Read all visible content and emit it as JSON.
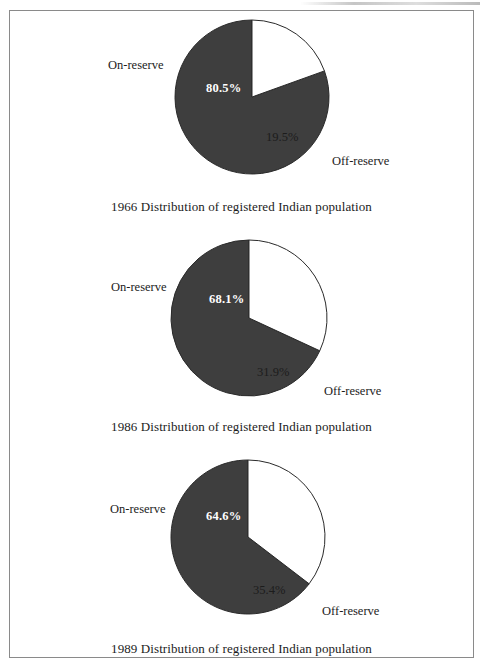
{
  "figure": {
    "background_color": "#ffffff",
    "frame_color": "#8a8a8a",
    "slice_dark_color": "#3e3e3e",
    "slice_light_color": "#ffffff",
    "slice_outline_color": "#2a2a2a"
  },
  "chart_data": [
    {
      "type": "pie",
      "title": "1966 Distribution of registered Indian population",
      "categories": [
        "On-reserve",
        "Off-reserve"
      ],
      "values": [
        80.5,
        19.5
      ],
      "value_labels": [
        "80.5%",
        "19.5%"
      ],
      "colors": [
        "#3e3e3e",
        "#ffffff"
      ],
      "start_angle_deg": 90,
      "direction": "counterclockwise",
      "legend": "direct-labels",
      "grid": false,
      "xlabel": "",
      "ylabel": ""
    },
    {
      "type": "pie",
      "title": "1986 Distribution of registered Indian population",
      "categories": [
        "On-reserve",
        "Off-reserve"
      ],
      "values": [
        68.1,
        31.9
      ],
      "value_labels": [
        "68.1%",
        "31.9%"
      ],
      "colors": [
        "#3e3e3e",
        "#ffffff"
      ],
      "start_angle_deg": 90,
      "direction": "counterclockwise",
      "legend": "direct-labels",
      "grid": false,
      "xlabel": "",
      "ylabel": ""
    },
    {
      "type": "pie",
      "title": "1989 Distribution of registered Indian population",
      "categories": [
        "On-reserve",
        "Off-reserve"
      ],
      "values": [
        64.6,
        35.4
      ],
      "value_labels": [
        "64.6%",
        "35.4%"
      ],
      "colors": [
        "#3e3e3e",
        "#ffffff"
      ],
      "start_angle_deg": 90,
      "direction": "counterclockwise",
      "legend": "direct-labels",
      "grid": false,
      "xlabel": "",
      "ylabel": ""
    }
  ],
  "charts": [
    {
      "caption": "1966 Distribution of registered Indian population",
      "major_label": "80.5%",
      "minor_label": "19.5%",
      "on_reserve_label": "On-reserve",
      "off_reserve_label": "Off-reserve"
    },
    {
      "caption": "1986 Distribution of registered Indian population",
      "major_label": "68.1%",
      "minor_label": "31.9%",
      "on_reserve_label": "On-reserve",
      "off_reserve_label": "Off-reserve"
    },
    {
      "caption": "1989 Distribution of registered Indian population",
      "major_label": "64.6%",
      "minor_label": "35.4%",
      "on_reserve_label": "On-reserve",
      "off_reserve_label": "Off-reserve"
    }
  ]
}
